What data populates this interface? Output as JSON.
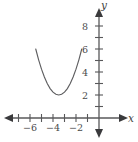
{
  "chart_data": {
    "type": "line",
    "title": "",
    "subtitle": "",
    "xlabel": "x",
    "ylabel": "y",
    "grid": false,
    "legend": null,
    "xlim": [
      -7.6,
      1.6
    ],
    "ylim": [
      -1.6,
      9.6
    ],
    "x_ticks": [
      -7,
      -6,
      -5,
      -4,
      -3,
      -2,
      -1
    ],
    "y_ticks": [
      1,
      2,
      3,
      4,
      5,
      6,
      7,
      8
    ],
    "x_tick_labels": [
      {
        "value": -6,
        "text": "−6"
      },
      {
        "value": -4,
        "text": "−4"
      },
      {
        "value": -2,
        "text": "−2"
      }
    ],
    "y_tick_labels": [
      {
        "value": 2,
        "text": "2"
      },
      {
        "value": 4,
        "text": "4"
      },
      {
        "value": 6,
        "text": "6"
      },
      {
        "value": 8,
        "text": "8"
      }
    ],
    "series": [
      {
        "name": "parabola",
        "equation": "y = (x + 3.5)^2 + 2",
        "vertex": [
          -3.5,
          2
        ],
        "x_start": -5.5,
        "x_end": -1.5,
        "points": [
          {
            "x": -5.5,
            "y": 6.0
          },
          {
            "x": -5.25,
            "y": 5.06
          },
          {
            "x": -5.0,
            "y": 4.25
          },
          {
            "x": -4.75,
            "y": 3.56
          },
          {
            "x": -4.5,
            "y": 3.0
          },
          {
            "x": -4.25,
            "y": 2.56
          },
          {
            "x": -4.0,
            "y": 2.25
          },
          {
            "x": -3.75,
            "y": 2.06
          },
          {
            "x": -3.5,
            "y": 2.0
          },
          {
            "x": -3.25,
            "y": 2.06
          },
          {
            "x": -3.0,
            "y": 2.25
          },
          {
            "x": -2.75,
            "y": 2.56
          },
          {
            "x": -2.5,
            "y": 3.0
          },
          {
            "x": -2.25,
            "y": 3.56
          },
          {
            "x": -2.0,
            "y": 4.25
          },
          {
            "x": -1.75,
            "y": 5.06
          },
          {
            "x": -1.5,
            "y": 6.0
          }
        ]
      }
    ],
    "colors": {
      "axis": "#58585a",
      "curve": "#5e5e60",
      "label": "#4a4a4c",
      "background": "#ffffff"
    }
  },
  "axes": {
    "x_axis_name": "x",
    "y_axis_name": "y"
  }
}
